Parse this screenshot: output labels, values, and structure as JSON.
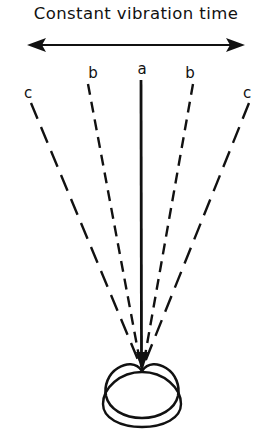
{
  "figure": {
    "title": "Constant vibration time",
    "background_color": "#ffffff",
    "ink_color": "#111111",
    "width": 272,
    "height": 443
  },
  "arrow": {
    "name": "double-headed-horizontal-arrow",
    "direction": "both",
    "y": 45,
    "x_start": 27,
    "x_end": 245
  },
  "labels": [
    {
      "text": "c",
      "x": 28,
      "y": 86
    },
    {
      "text": "b",
      "x": 93,
      "y": 66
    },
    {
      "text": "a",
      "x": 142,
      "y": 62
    },
    {
      "text": "b",
      "x": 190,
      "y": 66
    },
    {
      "text": "c",
      "x": 247,
      "y": 86
    }
  ],
  "rays": [
    {
      "name": "ray-c-left",
      "label": "c",
      "style": "long-dash",
      "x_top": 31,
      "y_top": 103,
      "x_tip": 141,
      "y_tip": 367
    },
    {
      "name": "ray-b-left",
      "label": "b",
      "style": "dash",
      "x_top": 88,
      "y_top": 84,
      "x_tip": 141,
      "y_tip": 367
    },
    {
      "name": "ray-a",
      "label": "a",
      "style": "solid",
      "x_top": 141,
      "y_top": 80,
      "x_tip": 141,
      "y_tip": 367
    },
    {
      "name": "ray-b-right",
      "label": "b",
      "style": "dash",
      "x_top": 193,
      "y_top": 84,
      "x_tip": 143,
      "y_tip": 367
    },
    {
      "name": "ray-c-right",
      "label": "c",
      "style": "long-dash",
      "x_top": 249,
      "y_top": 103,
      "x_tip": 143,
      "y_tip": 367
    }
  ],
  "specimen": {
    "name": "specimen-outline",
    "description": "rounded heart/apple shaped body with crescent beneath",
    "center_x": 142,
    "outer_top_y": 376,
    "outer_bottom_y": 426,
    "outer_left_x": 103,
    "outer_right_x": 182,
    "notch_y": 368
  }
}
